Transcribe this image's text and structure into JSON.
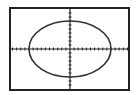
{
  "chart_data": {
    "type": "line",
    "title": "",
    "xlabel": "",
    "ylabel": "",
    "equation": "x^2/100 + y^2/49 = 1",
    "x_semi_axis_ticks": 10,
    "y_semi_axis_ticks": 7,
    "xlim": [
      -15,
      15
    ],
    "ylim": [
      -10,
      10
    ],
    "x_tick_step": 1,
    "y_tick_step": 1,
    "grid": false,
    "series": [
      {
        "name": "ellipse",
        "center": [
          0,
          0
        ],
        "rx": 10,
        "ry": 7,
        "color": "#333333"
      }
    ]
  },
  "colors": {
    "frame": "#222222",
    "axes": "#222222",
    "curve": "#333333",
    "background": "#ffffff"
  }
}
